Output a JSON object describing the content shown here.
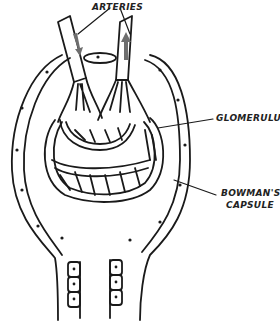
{
  "diagram": {
    "type": "anatomical illustration",
    "labels": {
      "arteries": "ARTERIES",
      "glomerulus": "GLOMERULUS",
      "bowmans_line1": "BOWMAN'S",
      "bowmans_line2": "CAPSULE"
    },
    "arrows": {
      "left_artery_flow": "down",
      "right_artery_flow": "up"
    },
    "colors": {
      "line": "#1a1a1a",
      "arrow_fill": "#6e6e6e",
      "background": "#ffffff"
    }
  }
}
